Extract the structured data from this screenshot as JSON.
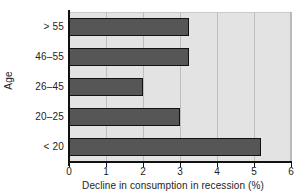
{
  "chart_data": {
    "type": "bar",
    "orientation": "horizontal",
    "title": "",
    "xlabel": "Decline in consumption in recession (%)",
    "ylabel": "Age",
    "categories": [
      "< 20",
      "20–25",
      "26–45",
      "46–55",
      "> 55"
    ],
    "values": [
      5.2,
      3.0,
      2.0,
      3.25,
      3.25
    ],
    "xlim": [
      0,
      6
    ],
    "xticks": [
      0,
      1,
      2,
      3,
      4,
      5,
      6
    ],
    "xtick_labels": [
      "0",
      "1",
      "2",
      "3",
      "4",
      "5",
      "6"
    ],
    "grid": "vertical",
    "legend": "none",
    "bar_color": "#565656",
    "bar_edge_color": "#111111",
    "plot_background": "#e3e3e3",
    "gridline_color": "#bdbdbd",
    "axis_color": "#111111",
    "figure_background": "#ffffff"
  }
}
